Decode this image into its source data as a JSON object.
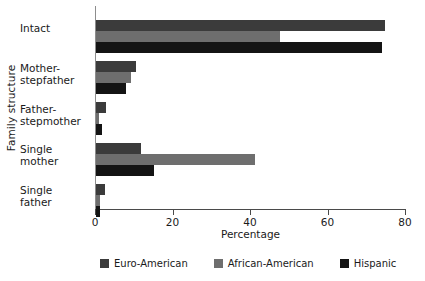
{
  "chart_data": {
    "type": "bar",
    "orientation": "horizontal",
    "title": "",
    "xlabel": "Percentage",
    "ylabel": "Family structure",
    "xlim": [
      0,
      80
    ],
    "xticks": [
      0,
      20,
      40,
      60,
      80
    ],
    "xtick_labels": [
      "0",
      "20",
      "40",
      "60",
      "80"
    ],
    "grid": false,
    "legend_position": "bottom",
    "categories": [
      "Intact",
      "Mother-stepfather",
      "Father-stepmother",
      "Single mother",
      "Single father"
    ],
    "category_lines": [
      [
        "Intact",
        ""
      ],
      [
        "Mother-",
        "stepfather"
      ],
      [
        "Father-",
        "stepmother"
      ],
      [
        "Single",
        "mother"
      ],
      [
        "Single",
        "father"
      ]
    ],
    "series": [
      {
        "name": "Euro-American",
        "color": "#3b3b3b",
        "values": [
          74.5,
          10.2,
          2.6,
          11.6,
          2.2
        ]
      },
      {
        "name": "African-American",
        "color": "#6e6e6e",
        "values": [
          47.5,
          9.0,
          0.7,
          41.0,
          1.0
        ]
      },
      {
        "name": "Hispanic",
        "color": "#141414",
        "values": [
          73.8,
          7.8,
          1.5,
          15.0,
          1.1
        ]
      }
    ]
  },
  "legend": {
    "items": [
      {
        "label": "Euro-American",
        "color": "#3b3b3b"
      },
      {
        "label": "African-American",
        "color": "#6e6e6e"
      },
      {
        "label": "Hispanic",
        "color": "#141414"
      }
    ]
  }
}
